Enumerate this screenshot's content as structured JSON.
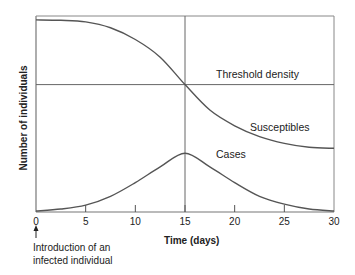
{
  "chart_data": {
    "type": "line",
    "title": "",
    "xlabel": "Time (days)",
    "ylabel": "Number of individuals",
    "xlim": [
      0,
      30
    ],
    "ylim": [
      0,
      100
    ],
    "x_ticks": [
      0,
      5,
      10,
      15,
      20,
      25,
      30
    ],
    "y_ticks": [],
    "grid": false,
    "legend": "none (series labeled inline)",
    "x": [
      0,
      2.5,
      5,
      7.5,
      10,
      12.5,
      15,
      17.5,
      20,
      22.5,
      25,
      27.5,
      30
    ],
    "series": [
      {
        "name": "Susceptibles",
        "values": [
          98,
          97.8,
          97,
          94,
          88,
          79,
          65,
          52,
          44,
          38.5,
          35,
          33,
          32.5
        ]
      },
      {
        "name": "Cases",
        "values": [
          0.5,
          1.5,
          3.5,
          8,
          15,
          23,
          30,
          23,
          15,
          8,
          4,
          1.5,
          0.5
        ]
      }
    ],
    "reference_lines": [
      {
        "orientation": "horizontal",
        "y": 65,
        "label": "Threshold density"
      },
      {
        "orientation": "vertical",
        "x": 15,
        "label": ""
      }
    ],
    "annotations": [
      {
        "x": 0,
        "text": "Introduction of an infected individual",
        "arrow": "up"
      }
    ]
  },
  "labels": {
    "threshold": "Threshold density",
    "susceptibles": "Susceptibles",
    "cases": "Cases",
    "xlabel": "Time (days)",
    "ylabel": "Number of individuals",
    "note_line1": "Introduction of an",
    "note_line2": "infected individual"
  },
  "colors": {
    "line": "#555555",
    "frame": "#777777",
    "text": "#222222"
  }
}
